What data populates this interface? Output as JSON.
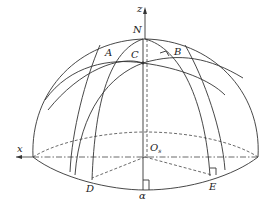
{
  "diagram": {
    "type": "hemisphere-geometry",
    "labels": {
      "z": "z",
      "N": "N",
      "A": "A",
      "B": "B",
      "C": "C",
      "x": "x",
      "O": "O",
      "O_sub": "s",
      "D": "D",
      "alpha": "α",
      "E": "E"
    },
    "colors": {
      "stroke": "#333333",
      "background": "#ffffff"
    }
  }
}
